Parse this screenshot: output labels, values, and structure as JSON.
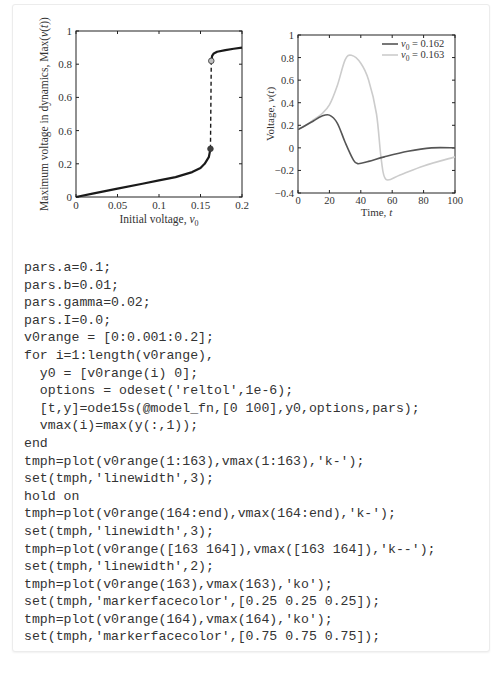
{
  "figure_left": {
    "ylabel": "Maximum voltage in dynamics, Max(v(t))",
    "xlabel": "Initial voltage, v0",
    "xticks": [
      "0",
      "0.05",
      "0.1",
      "0.15",
      "0.2"
    ],
    "yticks": [
      "0",
      "0.2",
      "0.6",
      "0.6",
      "0.8",
      "1"
    ]
  },
  "figure_right": {
    "ylabel": "Voltage, v(t)",
    "xlabel": "Time, t",
    "xticks": [
      "0",
      "20",
      "40",
      "60",
      "80",
      "100"
    ],
    "yticks": [
      "−0.4",
      "−0.2",
      "0",
      "0.2",
      "0.4",
      "0.6",
      "0.8",
      "1"
    ],
    "legend": [
      "v0 = 0.162",
      "v0 = 0.163"
    ]
  },
  "chart_data": [
    {
      "type": "line",
      "title": "",
      "xlabel": "Initial voltage, v0",
      "ylabel": "Maximum voltage in dynamics, Max(v(t))",
      "xlim": [
        0,
        0.2
      ],
      "ylim": [
        0,
        1
      ],
      "xticks": [
        0,
        0.05,
        0.1,
        0.15,
        0.2
      ],
      "ytick_labels": [
        "0",
        "0.2",
        "0.6",
        "0.6",
        "0.8",
        "1"
      ],
      "grid": false,
      "series": [
        {
          "name": "vmax (1:163)",
          "style": "solid black thick",
          "x": [
            0,
            0.02,
            0.05,
            0.08,
            0.1,
            0.12,
            0.14,
            0.15,
            0.155,
            0.16,
            0.162
          ],
          "y": [
            0,
            0.02,
            0.05,
            0.08,
            0.1,
            0.12,
            0.15,
            0.175,
            0.2,
            0.24,
            0.29
          ]
        },
        {
          "name": "vmax (164:end)",
          "style": "solid black thick",
          "x": [
            0.163,
            0.164,
            0.166,
            0.17,
            0.18,
            0.19,
            0.2
          ],
          "y": [
            0.82,
            0.85,
            0.865,
            0.875,
            0.885,
            0.893,
            0.9
          ]
        },
        {
          "name": "jump",
          "style": "dashed black",
          "x": [
            0.162,
            0.163
          ],
          "y": [
            0.29,
            0.82
          ]
        }
      ],
      "markers": [
        {
          "x": 0.162,
          "y": 0.29,
          "facecolor": "#404040"
        },
        {
          "x": 0.163,
          "y": 0.82,
          "facecolor": "#bfbfbf"
        }
      ]
    },
    {
      "type": "line",
      "title": "",
      "xlabel": "Time, t",
      "ylabel": "Voltage, v(t)",
      "xlim": [
        0,
        100
      ],
      "ylim": [
        -0.4,
        1
      ],
      "xticks": [
        0,
        20,
        40,
        60,
        80,
        100
      ],
      "yticks": [
        -0.4,
        -0.2,
        0,
        0.2,
        0.4,
        0.6,
        0.8,
        1
      ],
      "grid": false,
      "legend_position": "upper right",
      "series": [
        {
          "name": "v0 = 0.162",
          "color": "#555555",
          "x": [
            0,
            5,
            10,
            15,
            20,
            25,
            30,
            35,
            38,
            45,
            55,
            70,
            85,
            100
          ],
          "y": [
            0.162,
            0.2,
            0.24,
            0.28,
            0.29,
            0.22,
            0.05,
            -0.1,
            -0.14,
            -0.12,
            -0.08,
            -0.03,
            0.0,
            0.0
          ]
        },
        {
          "name": "v0 = 0.163",
          "color": "#cccccc",
          "x": [
            0,
            5,
            10,
            15,
            20,
            25,
            30,
            34,
            40,
            45,
            50,
            53,
            56,
            65,
            80,
            100
          ],
          "y": [
            0.163,
            0.2,
            0.25,
            0.3,
            0.38,
            0.55,
            0.78,
            0.82,
            0.75,
            0.6,
            0.3,
            -0.1,
            -0.28,
            -0.24,
            -0.16,
            -0.08
          ]
        }
      ]
    }
  ],
  "code": {
    "lines": [
      "pars.a=0.1;",
      "pars.b=0.01;",
      "pars.gamma=0.02;",
      "pars.I=0.0;",
      "v0range = [0:0.001:0.2];",
      "for i=1:length(v0range),",
      "  y0 = [v0range(i) 0];",
      "  options = odeset('reltol',1e-6);",
      "  [t,y]=ode15s(@model_fn,[0 100],y0,options,pars);",
      "  vmax(i)=max(y(:,1));",
      "end",
      "tmph=plot(v0range(1:163),vmax(1:163),'k-');",
      "set(tmph,'linewidth',3);",
      "hold on",
      "tmph=plot(v0range(164:end),vmax(164:end),'k-');",
      "set(tmph,'linewidth',3);",
      "tmph=plot(v0range([163 164]),vmax([163 164]),'k--');",
      "set(tmph,'linewidth',2);",
      "tmph=plot(v0range(163),vmax(163),'ko');",
      "set(tmph,'markerfacecolor',[0.25 0.25 0.25]);",
      "tmph=plot(v0range(164),vmax(164),'ko');",
      "set(tmph,'markerfacecolor',[0.75 0.75 0.75]);"
    ]
  }
}
